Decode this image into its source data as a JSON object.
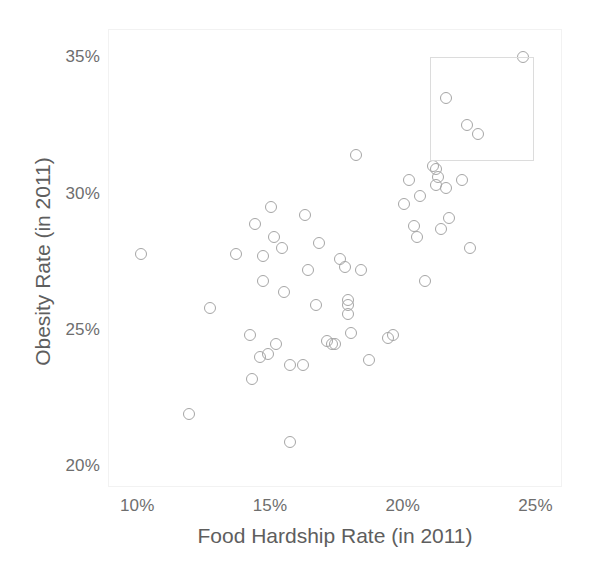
{
  "chart_data": {
    "type": "scatter",
    "title": "",
    "xlabel": "Food Hardship Rate (in 2011)",
    "ylabel": "Obesity Rate (in 2011)",
    "xlim": [
      8.9,
      26.0
    ],
    "ylim": [
      19.2,
      36.0
    ],
    "grid": false,
    "legend": null,
    "x_ticks": [
      10,
      15,
      20,
      25
    ],
    "x_tick_labels": [
      "10%",
      "15%",
      "20%",
      "25%"
    ],
    "y_ticks": [
      20,
      25,
      30,
      35
    ],
    "y_tick_labels": [
      "20%",
      "25%",
      "30%",
      "35%"
    ],
    "marker": {
      "shape": "circle-open",
      "diameter_px": 12,
      "stroke_color": "#a6a6a6",
      "fill": "none"
    },
    "annotations": [
      {
        "type": "rectangle",
        "name": "highlight-box",
        "x_range": [
          21.0,
          24.9
        ],
        "y_range": [
          31.2,
          35.0
        ],
        "stroke_color": "#dcdcdc",
        "fill": "none"
      }
    ],
    "points": [
      {
        "x": 10.1,
        "y": 27.8
      },
      {
        "x": 11.9,
        "y": 21.9
      },
      {
        "x": 12.7,
        "y": 25.8
      },
      {
        "x": 13.7,
        "y": 27.8
      },
      {
        "x": 14.2,
        "y": 24.8
      },
      {
        "x": 14.3,
        "y": 23.2
      },
      {
        "x": 14.4,
        "y": 28.9
      },
      {
        "x": 14.6,
        "y": 24.0
      },
      {
        "x": 14.7,
        "y": 27.7
      },
      {
        "x": 14.7,
        "y": 26.8
      },
      {
        "x": 14.9,
        "y": 24.1
      },
      {
        "x": 15.0,
        "y": 29.5
      },
      {
        "x": 15.1,
        "y": 28.4
      },
      {
        "x": 15.2,
        "y": 24.5
      },
      {
        "x": 15.4,
        "y": 28.0
      },
      {
        "x": 15.5,
        "y": 26.4
      },
      {
        "x": 15.7,
        "y": 20.9
      },
      {
        "x": 15.7,
        "y": 23.7
      },
      {
        "x": 16.2,
        "y": 23.7
      },
      {
        "x": 16.3,
        "y": 29.2
      },
      {
        "x": 16.4,
        "y": 27.2
      },
      {
        "x": 16.7,
        "y": 25.9
      },
      {
        "x": 16.8,
        "y": 28.2
      },
      {
        "x": 17.1,
        "y": 24.6
      },
      {
        "x": 17.3,
        "y": 24.5
      },
      {
        "x": 17.4,
        "y": 24.5
      },
      {
        "x": 17.6,
        "y": 27.6
      },
      {
        "x": 17.8,
        "y": 27.3
      },
      {
        "x": 17.9,
        "y": 26.1
      },
      {
        "x": 17.9,
        "y": 25.9
      },
      {
        "x": 17.9,
        "y": 25.6
      },
      {
        "x": 18.0,
        "y": 24.9
      },
      {
        "x": 18.2,
        "y": 31.4
      },
      {
        "x": 18.4,
        "y": 27.2
      },
      {
        "x": 18.7,
        "y": 23.9
      },
      {
        "x": 19.4,
        "y": 24.7
      },
      {
        "x": 19.6,
        "y": 24.8
      },
      {
        "x": 20.0,
        "y": 29.6
      },
      {
        "x": 20.2,
        "y": 30.5
      },
      {
        "x": 20.4,
        "y": 28.8
      },
      {
        "x": 20.5,
        "y": 28.4
      },
      {
        "x": 20.6,
        "y": 29.9
      },
      {
        "x": 20.8,
        "y": 26.8
      },
      {
        "x": 21.1,
        "y": 31.0
      },
      {
        "x": 21.2,
        "y": 30.9
      },
      {
        "x": 21.2,
        "y": 30.3
      },
      {
        "x": 21.3,
        "y": 30.6
      },
      {
        "x": 21.4,
        "y": 28.7
      },
      {
        "x": 21.6,
        "y": 33.5
      },
      {
        "x": 21.6,
        "y": 30.2
      },
      {
        "x": 21.7,
        "y": 29.1
      },
      {
        "x": 22.2,
        "y": 30.5
      },
      {
        "x": 22.4,
        "y": 32.5
      },
      {
        "x": 22.5,
        "y": 28.0
      },
      {
        "x": 22.8,
        "y": 32.2
      },
      {
        "x": 24.5,
        "y": 35.0
      }
    ]
  }
}
